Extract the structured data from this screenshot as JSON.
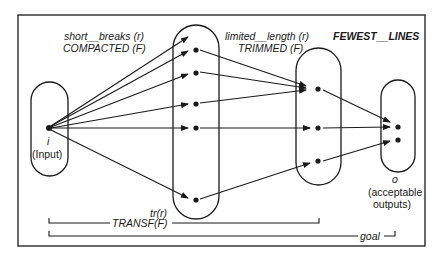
{
  "diagram": {
    "labels": {
      "stage1_relation": "short__breaks (r)",
      "stage1_function": "COMPACTED (F)",
      "stage2_relation": "limited__length (r)",
      "stage2_function": "TRIMMED (F)",
      "stage3_function": "FEWEST__LINES",
      "input_symbol": "i",
      "input_caption": "(Input)",
      "output_symbol": "o",
      "output_caption_line1": "(acceptable",
      "output_caption_line2": "outputs)",
      "transf_relation": "tr(r)",
      "transf_function": "TRANSF(F)",
      "goal": "goal"
    },
    "sets": [
      {
        "name": "input",
        "points": 1
      },
      {
        "name": "compacted",
        "points": 5
      },
      {
        "name": "trimmed",
        "points": 3
      },
      {
        "name": "acceptable-outputs",
        "points": 2
      }
    ],
    "colors": {
      "ink": "#1a1a1a",
      "background": "#ffffff"
    }
  }
}
